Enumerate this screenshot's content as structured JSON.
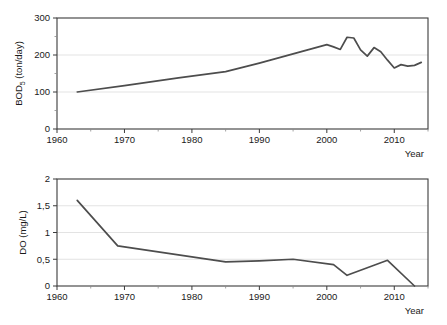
{
  "figure": {
    "background_color": "#ffffff",
    "line_color": "#4d4d4d",
    "axis_color": "#3b3b3b",
    "grid_color": "#dcdcdc"
  },
  "chart_data": [
    {
      "id": "bod",
      "type": "line",
      "title": "",
      "xlabel": "Year",
      "ylabel": "BOD",
      "ylabel_subscript": "5",
      "ylabel_unit": " (ton/day)",
      "ylabel_full": "BOD5 (ton/day)",
      "xlim": [
        1960,
        2015
      ],
      "ylim": [
        0,
        300
      ],
      "xticks": [
        1960,
        1970,
        1980,
        1990,
        2000,
        2010
      ],
      "xtick_labels": [
        "1960",
        "1970",
        "1980",
        "1990",
        "2000",
        "2010"
      ],
      "yticks": [
        0,
        100,
        200,
        300
      ],
      "ytick_labels": [
        "0",
        "100",
        "200",
        "300"
      ],
      "y_minor_ticks": [
        50,
        150,
        250
      ],
      "x_minor_ticks": [
        1965,
        1975,
        1985,
        1995,
        2005,
        2015
      ],
      "grid": "horizontal",
      "legend": "none",
      "series": [
        {
          "name": "BOD5 load",
          "color": "#4d4d4d",
          "x": [
            1963,
            1970,
            1978,
            1985,
            1990,
            1995,
            2000,
            2001,
            2002,
            2003,
            2004,
            2005,
            2006,
            2007,
            2008,
            2009,
            2010,
            2011,
            2012,
            2013,
            2014
          ],
          "y": [
            100,
            117,
            138,
            155,
            178,
            203,
            228,
            222,
            215,
            248,
            246,
            214,
            197,
            220,
            209,
            186,
            165,
            174,
            170,
            172,
            180
          ]
        }
      ]
    },
    {
      "id": "do",
      "type": "line",
      "title": "",
      "xlabel": "Year",
      "ylabel": "DO (mg/L)",
      "xlim": [
        1960,
        2015
      ],
      "ylim": [
        0,
        2
      ],
      "xticks": [
        1960,
        1970,
        1980,
        1990,
        2000,
        2010
      ],
      "xtick_labels": [
        "1960",
        "1970",
        "1980",
        "1990",
        "2000",
        "2010"
      ],
      "yticks": [
        0,
        0.5,
        1,
        1.5,
        2
      ],
      "ytick_labels": [
        "0",
        "0,5",
        "1",
        "1,5",
        "2"
      ],
      "x_minor_ticks": [
        1965,
        1975,
        1985,
        1995,
        2005,
        2015
      ],
      "grid": "horizontal",
      "legend": "none",
      "series": [
        {
          "name": "DO concentration",
          "color": "#4d4d4d",
          "x": [
            1963,
            1969,
            1977,
            1985,
            1990,
            1995,
            2001,
            2003,
            2009,
            2013
          ],
          "y": [
            1.6,
            0.75,
            0.6,
            0.45,
            0.47,
            0.5,
            0.4,
            0.2,
            0.48,
            0.0
          ]
        }
      ]
    }
  ]
}
